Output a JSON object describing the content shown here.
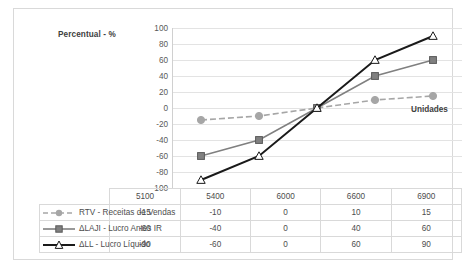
{
  "chart_data": {
    "type": "line",
    "title": "",
    "xlabel": "Unidades",
    "ylabel": "Percentual - %",
    "categories": [
      "5100",
      "5400",
      "6000",
      "6600",
      "6900"
    ],
    "ylim": [
      -100,
      100
    ],
    "yticks": [
      100,
      80,
      60,
      40,
      20,
      0,
      -20,
      -40,
      -60,
      -80,
      -100
    ],
    "grid": true,
    "legend_position": "table-left",
    "series": [
      {
        "name": "RTV - Receitas de Vendas",
        "values": [
          -15,
          -10,
          0,
          10,
          15
        ],
        "color": "#a6a6a6",
        "marker": "circle",
        "line_style": "dashed"
      },
      {
        "name": "ΔLAJI - Lucro Antes IR",
        "values": [
          -60,
          -40,
          0,
          40,
          60
        ],
        "color": "#808080",
        "marker": "square",
        "line_style": "solid"
      },
      {
        "name": "ΔLL - Lucro Líquido",
        "values": [
          -90,
          -60,
          0,
          60,
          90
        ],
        "color": "#1a1a1a",
        "marker": "triangle-open",
        "line_style": "solid"
      }
    ]
  },
  "axis_labels": {
    "y_title": "Percentual - %",
    "x_title": "Unidades"
  },
  "table": {
    "header": [
      "",
      "5100",
      "5400",
      "6000",
      "6600",
      "6900"
    ],
    "rows": [
      {
        "label": "RTV - Receitas de Vendas",
        "values": [
          "-15",
          "-10",
          "0",
          "10",
          "15"
        ]
      },
      {
        "label": "ΔLAJI - Lucro Antes IR",
        "values": [
          "-60",
          "-40",
          "0",
          "40",
          "60"
        ]
      },
      {
        "label": "ΔLL - Lucro Líquido",
        "values": [
          "-90",
          "-60",
          "0",
          "60",
          "90"
        ]
      }
    ]
  },
  "colors": {
    "series1": "#a6a6a6",
    "series2": "#808080",
    "series3": "#1a1a1a",
    "gridline": "#e3e3e3",
    "border": "#d9d9d9"
  }
}
